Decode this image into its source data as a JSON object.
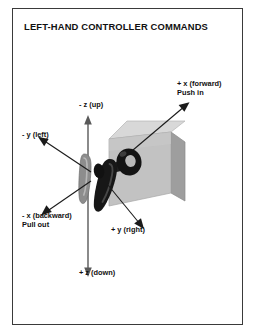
{
  "figure": {
    "title": "LEFT-HAND CONTROLLER COMMANDS",
    "frame_color": "#3a3a3a",
    "background": "#ffffff"
  },
  "axes": [
    {
      "id": "z-up",
      "line1": "- z (up)",
      "line2": "",
      "direction": "up",
      "arrow_color": "#4a4a4a"
    },
    {
      "id": "x-forward",
      "line1": "+ x (forward)",
      "line2": "Push in",
      "direction": "up-right",
      "arrow_color": "#1a1a1a"
    },
    {
      "id": "y-left",
      "line1": "- y (left)",
      "line2": "",
      "direction": "up-left",
      "arrow_color": "#1a1a1a"
    },
    {
      "id": "x-backward",
      "line1": "- x (backward)",
      "line2": "Pull out",
      "direction": "down-left",
      "arrow_color": "#1a1a1a"
    },
    {
      "id": "y-right",
      "line1": "+ y (right)",
      "line2": "",
      "direction": "down-right",
      "arrow_color": "#1a1a1a"
    },
    {
      "id": "z-down",
      "line1": "+ z (down)",
      "line2": "",
      "direction": "down",
      "arrow_color": "#4a4a4a"
    }
  ],
  "object": {
    "name": "controller-housing-box",
    "top_face_color": "#d6d6d6",
    "front_face_color": "#bdbdbd",
    "side_face_color": "#9e9e9e",
    "handle_color": "#1c1c1c",
    "lever_color": "#7d7d7d"
  }
}
